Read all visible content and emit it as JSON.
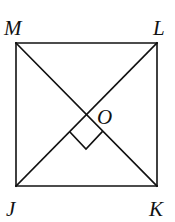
{
  "diagram": {
    "type": "geometry",
    "shape": "square",
    "colors": {
      "stroke": "#111111",
      "background": "#ffffff"
    },
    "vertices": [
      {
        "name": "M",
        "label": "M",
        "x": 16,
        "y": 43
      },
      {
        "name": "L",
        "label": "L",
        "x": 157,
        "y": 43
      },
      {
        "name": "K",
        "label": "K",
        "x": 157,
        "y": 186
      },
      {
        "name": "J",
        "label": "J",
        "x": 16,
        "y": 186
      }
    ],
    "center": {
      "name": "O",
      "label": "O",
      "x": 86,
      "y": 115
    },
    "diagonals": [
      "MK",
      "JL"
    ],
    "right_angle_mark": {
      "at": "O",
      "between": [
        "OJ",
        "OK"
      ]
    }
  }
}
